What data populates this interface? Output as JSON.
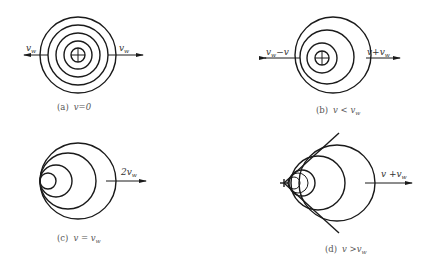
{
  "figure": {
    "panels": [
      {
        "id": "a",
        "caption_label": "(a)",
        "caption_condition": "v=0",
        "left_arrow_label": "v_w",
        "right_arrow_label": "v_w",
        "source_marker": "circle-plus"
      },
      {
        "id": "b",
        "caption_label": "(b)",
        "caption_condition": "v < v_w",
        "left_arrow_label": "v_w−v",
        "right_arrow_label": "v+v_w",
        "source_marker": "circle-plus"
      },
      {
        "id": "c",
        "caption_label": "(c)",
        "caption_condition": "v = v_w",
        "right_arrow_label": "2v_w"
      },
      {
        "id": "d",
        "caption_label": "(d)",
        "caption_condition": "v >v_w",
        "right_arrow_label": "v +v_w",
        "source_marker": "cross"
      }
    ],
    "text": {
      "a_left_main": "v",
      "a_left_sub": "w",
      "a_right_main": "v",
      "a_right_sub": "w",
      "a_cap_label": "(a)",
      "a_cap_cond": "v=0",
      "b_left_main": "v",
      "b_left_sub": "w",
      "b_left_tail": "−v",
      "b_right_head": "v+v",
      "b_right_sub": "w",
      "b_cap_label": "(b)",
      "b_cap_main": "v < v",
      "b_cap_sub": "w",
      "c_right_main": "2v",
      "c_right_sub": "w",
      "c_cap_label": "(c)",
      "c_cap_main": "v = v",
      "c_cap_sub": "w",
      "d_right_main": "v +v",
      "d_right_sub": "w",
      "d_cap_label": "(d)",
      "d_cap_main": "v >v",
      "d_cap_sub": "w"
    }
  }
}
